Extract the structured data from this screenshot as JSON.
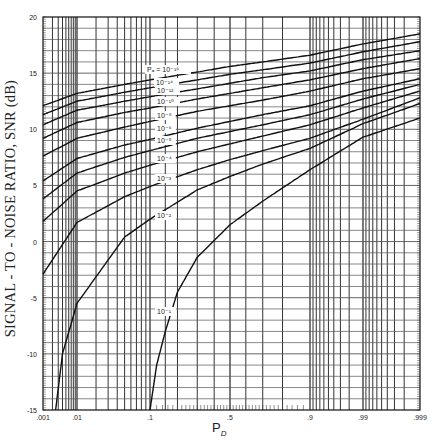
{
  "chart_data": {
    "type": "line",
    "title": "",
    "xlabel": "P_D",
    "ylabel": "SIGNAL - TO - NOISE RATIO, SNR (dB)",
    "xscale": "probability (normal)",
    "xlim": [
      0.001,
      0.999
    ],
    "ylim": [
      -15,
      20
    ],
    "grid": true,
    "x_ticks": [
      {
        "value": 0.001,
        "label": ".001"
      },
      {
        "value": 0.01,
        "label": ".01"
      },
      {
        "value": 0.1,
        "label": ".1"
      },
      {
        "value": 0.5,
        "label": ".5"
      },
      {
        "value": 0.9,
        "label": ".9"
      },
      {
        "value": 0.99,
        "label": ".99"
      },
      {
        "value": 0.999,
        "label": ".999"
      }
    ],
    "y_ticks": [
      -15,
      -10,
      -5,
      0,
      5,
      10,
      15,
      20
    ],
    "legend_title": "P_fa =",
    "series": [
      {
        "name": "10^-16",
        "label": "10⁻¹⁶",
        "label_prefix": "P_fa = ",
        "x": [
          0.001,
          0.01,
          0.05,
          0.1,
          0.3,
          0.5,
          0.7,
          0.9,
          0.99,
          0.999
        ],
        "y": [
          12.1,
          13.2,
          14.0,
          14.4,
          15.1,
          15.6,
          16.0,
          16.6,
          17.6,
          18.5
        ]
      },
      {
        "name": "10^-14",
        "label": "10⁻¹⁴",
        "x": [
          0.001,
          0.01,
          0.05,
          0.1,
          0.3,
          0.5,
          0.7,
          0.9,
          0.99,
          0.999
        ],
        "y": [
          11.3,
          12.5,
          13.3,
          13.7,
          14.4,
          14.9,
          15.3,
          15.9,
          16.9,
          17.8
        ]
      },
      {
        "name": "10^-12",
        "label": "10⁻¹²",
        "x": [
          0.001,
          0.01,
          0.05,
          0.1,
          0.3,
          0.5,
          0.7,
          0.9,
          0.99,
          0.999
        ],
        "y": [
          10.4,
          11.7,
          12.5,
          12.9,
          13.6,
          14.1,
          14.6,
          15.2,
          16.2,
          17.0
        ]
      },
      {
        "name": "10^-10",
        "label": "10⁻¹⁰",
        "x": [
          0.001,
          0.01,
          0.05,
          0.1,
          0.3,
          0.5,
          0.7,
          0.9,
          0.99,
          0.999
        ],
        "y": [
          9.2,
          10.6,
          11.5,
          11.9,
          12.7,
          13.2,
          13.7,
          14.4,
          15.4,
          16.3
        ]
      },
      {
        "name": "10^-8",
        "label": "10⁻⁸",
        "x": [
          0.001,
          0.01,
          0.05,
          0.1,
          0.3,
          0.5,
          0.7,
          0.9,
          0.99,
          0.999
        ],
        "y": [
          7.6,
          9.2,
          10.2,
          10.7,
          11.6,
          12.1,
          12.6,
          13.4,
          14.5,
          15.4
        ]
      },
      {
        "name": "10^-6",
        "label": "10⁻⁶",
        "x": [
          0.001,
          0.01,
          0.05,
          0.1,
          0.3,
          0.5,
          0.7,
          0.9,
          0.99,
          0.999
        ],
        "y": [
          5.4,
          7.4,
          8.6,
          9.1,
          10.1,
          10.7,
          11.3,
          12.1,
          13.4,
          14.5
        ]
      },
      {
        "name": "10^-5",
        "label": "10⁻⁵",
        "x": [
          0.001,
          0.01,
          0.05,
          0.1,
          0.3,
          0.5,
          0.7,
          0.9,
          0.99,
          0.999
        ],
        "y": [
          3.8,
          6.1,
          7.5,
          8.1,
          9.2,
          9.8,
          10.4,
          11.3,
          12.7,
          14.0
        ]
      },
      {
        "name": "10^-4",
        "label": "10⁻⁴",
        "x": [
          0.001,
          0.01,
          0.05,
          0.1,
          0.3,
          0.5,
          0.7,
          0.9,
          0.99,
          0.999
        ],
        "y": [
          1.8,
          4.5,
          6.1,
          6.8,
          8.0,
          8.7,
          9.4,
          10.4,
          11.9,
          13.4
        ]
      },
      {
        "name": "10^-3",
        "label": "10⁻³",
        "x": [
          0.001,
          0.01,
          0.05,
          0.1,
          0.3,
          0.5,
          0.7,
          0.9,
          0.99,
          0.999
        ],
        "y": [
          -2.9,
          1.7,
          4.0,
          4.9,
          6.4,
          7.3,
          8.1,
          9.2,
          10.9,
          12.8
        ]
      },
      {
        "name": "10^-2",
        "label": "10⁻²",
        "x": [
          0.0025,
          0.004,
          0.01,
          0.05,
          0.1,
          0.3,
          0.5,
          0.7,
          0.9,
          0.99,
          0.999
        ],
        "y": [
          -15,
          -10,
          -5.5,
          0.4,
          2.0,
          4.6,
          5.8,
          6.9,
          8.3,
          10.5,
          12.3
        ]
      },
      {
        "name": "10^-1",
        "label": "10⁻¹",
        "x": [
          0.1,
          0.12,
          0.15,
          0.2,
          0.3,
          0.5,
          0.7,
          0.9,
          0.99,
          0.999
        ],
        "y": [
          -15,
          -11,
          -8,
          -4.5,
          -1.4,
          1.5,
          3.6,
          6.4,
          9.3,
          11.0
        ]
      }
    ],
    "curve_labels": [
      {
        "series": "10^-16",
        "text": "Pₐ = 10⁻¹⁶",
        "px": 147,
        "py": 72
      },
      {
        "series": "10^-14",
        "text": "10⁻¹⁴",
        "px": 156,
        "py": 85
      },
      {
        "series": "10^-12",
        "text": "10⁻¹²",
        "px": 157,
        "py": 93
      },
      {
        "series": "10^-10",
        "text": "10⁻¹⁰",
        "px": 157,
        "py": 104
      },
      {
        "series": "10^-8",
        "text": "10⁻⁸",
        "px": 157,
        "py": 118
      },
      {
        "series": "10^-6",
        "text": "10⁻⁶",
        "px": 157,
        "py": 131
      },
      {
        "series": "10^-5",
        "text": "10⁻⁵",
        "px": 157,
        "py": 143
      },
      {
        "series": "10^-4",
        "text": "10⁻⁴",
        "px": 157,
        "py": 161
      },
      {
        "series": "10^-3",
        "text": "10⁻³",
        "px": 157,
        "py": 181
      },
      {
        "series": "10^-2",
        "text": "10⁻²",
        "px": 157,
        "py": 218
      },
      {
        "series": "10^-1",
        "text": "10⁻¹",
        "px": 157,
        "py": 314
      }
    ]
  },
  "axes": {
    "ylabel": "SIGNAL - TO - NOISE RATIO, SNR (dB)",
    "xlabel_main": "P",
    "xlabel_sub": "D"
  },
  "colors": {
    "line": "#111111",
    "grid": "#333333",
    "background": "#ffffff"
  }
}
